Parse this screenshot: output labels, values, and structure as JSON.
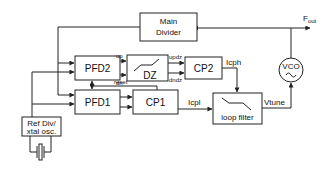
{
  "diagram": {
    "title": "",
    "blocks": {
      "main_divider": {
        "line1": "Main",
        "line2": "Divider"
      },
      "pfd2": {
        "label": "PFD2"
      },
      "dz": {
        "label": "DZ"
      },
      "cp2": {
        "label": "CP2"
      },
      "pfd1": {
        "label": "PFD1"
      },
      "cp1": {
        "label": "CP1"
      },
      "loop_filter": {
        "label": "loop filter"
      },
      "vco": {
        "label": "VCO"
      },
      "ref": {
        "line1": "Ref Div/",
        "line2": "xtal osc."
      }
    },
    "signals": {
      "up": "up",
      "dn": "dn",
      "updz": "updz",
      "dndz": "dndz",
      "icph": "Icph",
      "icpl": "Icpl",
      "reset": "reset",
      "vtune": "Vtune",
      "fout_main": "F",
      "fout_sub": "out"
    },
    "colors": {
      "stroke": "#222222",
      "background": "#ffffff"
    }
  }
}
